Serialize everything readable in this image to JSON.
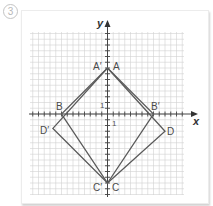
{
  "problem": {
    "number": "3"
  },
  "axes": {
    "x_label": "x",
    "y_label": "y",
    "unit_x_label": "1",
    "unit_y_label": "1"
  },
  "grid": {
    "x_min": -13,
    "x_max": 13,
    "y_min": -14,
    "y_max": 14,
    "cell_px": 5.75,
    "origin_px": [
      107.5,
      114
    ]
  },
  "colors": {
    "grid": "#d2d2d2",
    "axis": "#444444",
    "shape": "#5a5a5a"
  },
  "shapes": {
    "original": {
      "name": "ABCD",
      "vertices": [
        {
          "label": "A",
          "x": 0,
          "y": 8
        },
        {
          "label": "B",
          "x": -8,
          "y": 0
        },
        {
          "label": "C",
          "x": 0,
          "y": -12
        },
        {
          "label": "D",
          "x": 10,
          "y": -3
        }
      ]
    },
    "image": {
      "name": "A'B'C'D'",
      "vertices": [
        {
          "label": "A'",
          "x": 0,
          "y": 8
        },
        {
          "label": "B'",
          "x": 8,
          "y": 0
        },
        {
          "label": "C'",
          "x": 0,
          "y": -12
        },
        {
          "label": "D'",
          "x": -9.5,
          "y": -2.5
        }
      ]
    }
  },
  "labels": {
    "A": "A",
    "A_prime": "A′",
    "B": "B",
    "B_prime": "B′",
    "C": "C",
    "C_prime": "C′",
    "D": "D",
    "D_prime": "D′"
  }
}
